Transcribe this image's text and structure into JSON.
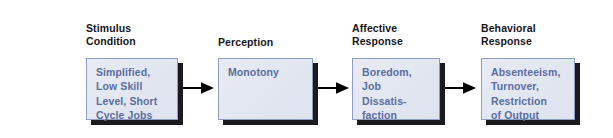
{
  "diagram": {
    "background_color": "#ffffff",
    "box_fill_color": "#e4e8f2",
    "box_border_color": "#8f9ec0",
    "box_shadow_color": "#1b1b1f",
    "box_text_color": "#5a6ea0",
    "label_text_color": "#16161a",
    "arrow_color": "#000000",
    "stages": [
      {
        "label": "Stimulus\nCondition",
        "box_text": "Simplified,\nLow Skill\nLevel, Short\nCycle Jobs"
      },
      {
        "label": "Perception",
        "box_text": "Monotony"
      },
      {
        "label": "Affective\nResponse",
        "box_text": "Boredom,\nJob\nDissatis-\nfaction"
      },
      {
        "label": "Behavioral\nResponse",
        "box_text": "Absenteeism,\nTurnover,\nRestriction\nof Output"
      }
    ],
    "connectors": [
      {
        "name": "arrow-stimulus-to-perception"
      },
      {
        "name": "arrow-perception-to-affective"
      },
      {
        "name": "arrow-affective-to-behavioral"
      }
    ]
  }
}
